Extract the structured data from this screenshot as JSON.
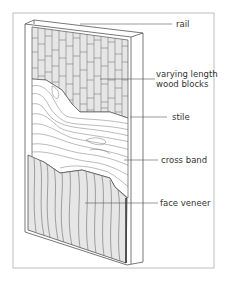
{
  "diagram": {
    "colors": {
      "frame": "#bdbdbd",
      "line": "#555555",
      "fill": "#e6e6e6",
      "bg": "#ffffff"
    },
    "labels": [
      {
        "id": "rail",
        "text": "rail"
      },
      {
        "id": "blocks",
        "line1": "varying length",
        "line2": "wood blocks"
      },
      {
        "id": "stile",
        "text": "stile"
      },
      {
        "id": "crossband",
        "text": "cross band"
      },
      {
        "id": "veneer",
        "text": "face veneer"
      }
    ]
  }
}
